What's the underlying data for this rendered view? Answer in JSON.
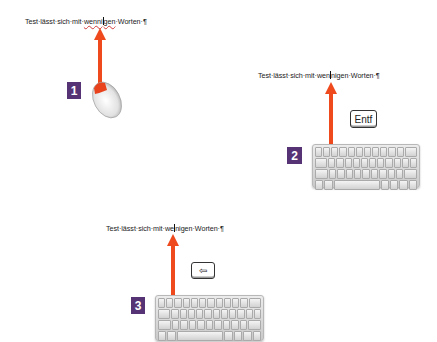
{
  "steps": [
    {
      "number": "1",
      "text_before": "Test·lässt·sich·mit·",
      "text_err": "wenni",
      "text_err_after": "gen",
      "text_after": "·Worten·¶",
      "device": "mouse"
    },
    {
      "number": "2",
      "text_before": "Test·lässt·sich·mit·wen",
      "text_after_caret": "nigen·Worten·¶",
      "key_label": "Entf",
      "device": "keyboard"
    },
    {
      "number": "3",
      "text_before": "Test·lässt·sich·mit·we",
      "text_after_caret": "nigen·Worten·¶",
      "key_label": "⇦",
      "device": "keyboard"
    }
  ],
  "colors": {
    "arrow": "#ee4a1e",
    "badge": "#553374",
    "spell_error": "#d23a3a"
  }
}
